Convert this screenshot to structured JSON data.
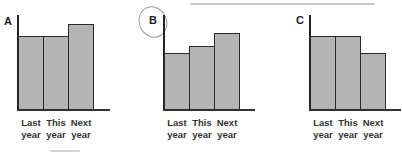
{
  "chart_data": [
    {
      "type": "bar",
      "title": "A",
      "categories": [
        "Last year",
        "This year",
        "Next year"
      ],
      "values": [
        80,
        80,
        93
      ],
      "xlabel": "",
      "ylabel": "",
      "ylim": [
        0,
        100
      ],
      "grid": false,
      "legend": null,
      "bar_color": "#b4b4b4"
    },
    {
      "type": "bar",
      "title": "B",
      "categories": [
        "Last year",
        "This year",
        "Next year"
      ],
      "values": [
        62,
        69,
        84
      ],
      "xlabel": "",
      "ylabel": "",
      "ylim": [
        0,
        100
      ],
      "grid": false,
      "legend": null,
      "annotation": "hand-drawn circle around label B",
      "bar_color": "#b4b4b4"
    },
    {
      "type": "bar",
      "title": "C",
      "categories": [
        "Last year",
        "This year",
        "Next year"
      ],
      "values": [
        80,
        80,
        62
      ],
      "xlabel": "",
      "ylabel": "",
      "ylim": [
        0,
        100
      ],
      "grid": false,
      "legend": null,
      "bar_color": "#b4b4b4"
    }
  ],
  "panels": [
    {
      "letter": "A",
      "labels": [
        "Last\nyear",
        "This\nyear",
        "Next\nyear"
      ]
    },
    {
      "letter": "B",
      "labels": [
        "Last\nyear",
        "This\nyear",
        "Next\nyear"
      ]
    },
    {
      "letter": "C",
      "labels": [
        "Last\nyear",
        "This\nyear",
        "Next\nyear"
      ]
    }
  ]
}
